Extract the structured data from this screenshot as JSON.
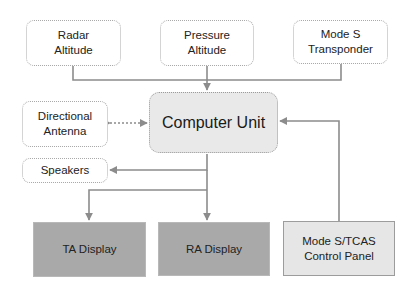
{
  "diagram": {
    "nodes": {
      "radar_altitude": {
        "label_line1": "Radar",
        "label_line2": "Altitude"
      },
      "pressure_altitude": {
        "label_line1": "Pressure",
        "label_line2": "Altitude"
      },
      "mode_s_transponder": {
        "label_line1": "Mode S",
        "label_line2": "Transponder"
      },
      "directional_antenna": {
        "label_line1": "Directional",
        "label_line2": "Antenna"
      },
      "computer_unit": {
        "label": "Computer Unit"
      },
      "speakers": {
        "label": "Speakers"
      },
      "ta_display": {
        "label": "TA Display"
      },
      "ra_display": {
        "label": "RA Display"
      },
      "control_panel": {
        "label_line1": "Mode S/TCAS",
        "label_line2": "Control Panel"
      }
    },
    "edges": [
      {
        "from": "Radar Altitude",
        "to": "Computer Unit",
        "style": "solid"
      },
      {
        "from": "Pressure Altitude",
        "to": "Computer Unit",
        "style": "solid"
      },
      {
        "from": "Mode S Transponder",
        "to": "Computer Unit",
        "style": "solid"
      },
      {
        "from": "Directional Antenna",
        "to": "Computer Unit",
        "style": "dotted",
        "bidirectional": true
      },
      {
        "from": "Computer Unit",
        "to": "Speakers",
        "style": "solid"
      },
      {
        "from": "Computer Unit",
        "to": "TA Display",
        "style": "solid"
      },
      {
        "from": "Computer Unit",
        "to": "RA Display",
        "style": "solid"
      },
      {
        "from": "Mode S/TCAS Control Panel",
        "to": "Computer Unit",
        "style": "solid"
      }
    ],
    "colors": {
      "line": "#8c8c8c",
      "computer_unit_fill": "#e9e9e9",
      "display_fill": "#a9a9a9",
      "panel_fill": "#e6e6e6"
    }
  }
}
